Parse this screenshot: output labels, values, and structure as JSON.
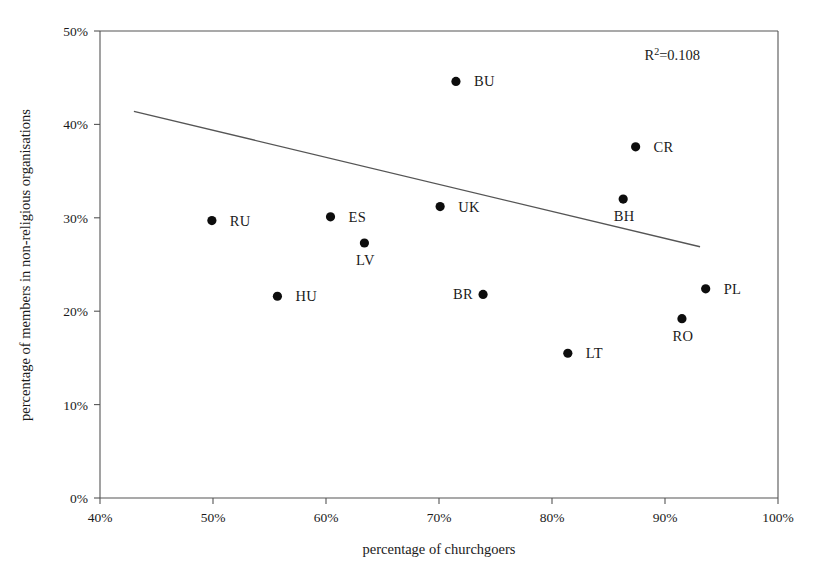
{
  "chart_data": {
    "type": "scatter",
    "title": "",
    "xlabel": "percentage of churchgoers",
    "ylabel": "percentage of members in non-religious organisations",
    "xlim": [
      40,
      100
    ],
    "ylim": [
      0,
      50
    ],
    "xticks": [
      "40%",
      "50%",
      "60%",
      "70%",
      "80%",
      "90%",
      "100%"
    ],
    "xtick_values": [
      40,
      50,
      60,
      70,
      80,
      90,
      100
    ],
    "yticks": [
      "0%",
      "10%",
      "20%",
      "30%",
      "40%",
      "50%"
    ],
    "ytick_values": [
      0,
      10,
      20,
      30,
      40,
      50
    ],
    "grid": false,
    "legend": false,
    "annotation": "R2=0.108",
    "annotation_base": "R",
    "annotation_sup": "2",
    "annotation_rest": "=0.108",
    "points": [
      {
        "label": "RU",
        "x": 49.9,
        "y": 29.7,
        "label_side": "right"
      },
      {
        "label": "HU",
        "x": 55.7,
        "y": 21.6,
        "label_side": "right"
      },
      {
        "label": "ES",
        "x": 60.4,
        "y": 30.1,
        "label_side": "right"
      },
      {
        "label": "LV",
        "x": 63.4,
        "y": 27.3,
        "label_side": "below"
      },
      {
        "label": "UK",
        "x": 70.1,
        "y": 31.2,
        "label_side": "right"
      },
      {
        "label": "BU",
        "x": 71.5,
        "y": 44.6,
        "label_side": "right"
      },
      {
        "label": "BR",
        "x": 73.9,
        "y": 21.8,
        "label_side": "left"
      },
      {
        "label": "LT",
        "x": 81.4,
        "y": 15.5,
        "label_side": "right"
      },
      {
        "label": "BH",
        "x": 86.3,
        "y": 32.0,
        "label_side": "below"
      },
      {
        "label": "CR",
        "x": 87.4,
        "y": 37.6,
        "label_side": "right"
      },
      {
        "label": "RO",
        "x": 91.5,
        "y": 19.2,
        "label_side": "below"
      },
      {
        "label": "PL",
        "x": 93.6,
        "y": 22.4,
        "label_side": "right"
      }
    ],
    "trendline": {
      "x_start": 43.0,
      "y_start": 41.4,
      "x_end": 93.1,
      "y_end": 26.9
    },
    "colors": {
      "point": "#0d0d0d",
      "line": "#555555",
      "axis": "#555555",
      "text": "#1a1a1a",
      "background": "#ffffff"
    }
  }
}
